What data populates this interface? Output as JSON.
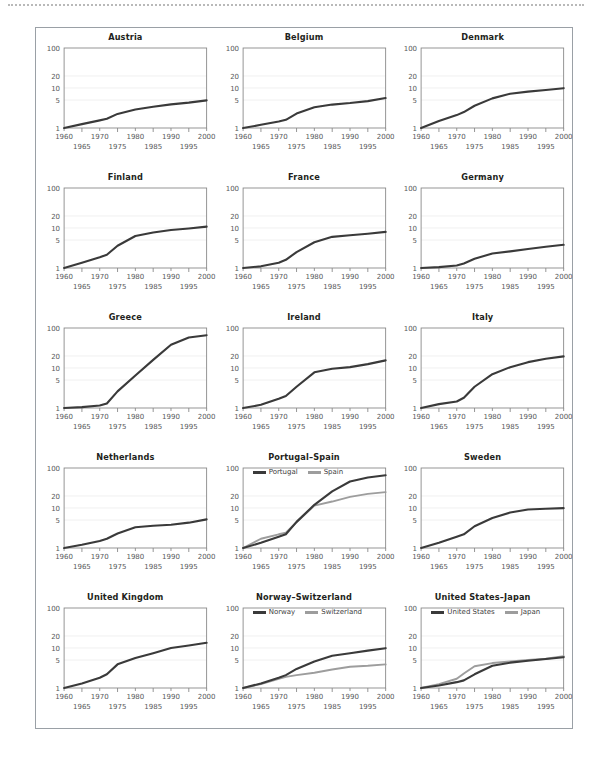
{
  "figure": {
    "layout": {
      "rows": 5,
      "cols": 3
    },
    "colors": {
      "series_primary": "#3a3a3a",
      "series_secondary": "#9d9d9d",
      "axis": "#8a8a8a",
      "grid": "#ececec",
      "tick_text": "#58595b",
      "title_text": "#231f20",
      "frame": "#9aa0a6",
      "top_rule": "#b9b9b9"
    }
  },
  "chart_data": [
    {
      "type": "line",
      "title": "Austria",
      "xlabel": "",
      "ylabel": "",
      "xlim": [
        1960,
        2000
      ],
      "ylim": [
        1,
        100
      ],
      "yscale": "log",
      "grid": true,
      "ytick_labels": [
        "1",
        "5",
        "10",
        "20",
        "100"
      ],
      "yticks": [
        1,
        5,
        10,
        20,
        100
      ],
      "xticks_major": [
        1960,
        1970,
        1980,
        1990,
        2000
      ],
      "xticks_minor": [
        1965,
        1975,
        1985,
        1995
      ],
      "x": [
        1960,
        1965,
        1970,
        1972,
        1975,
        1980,
        1985,
        1990,
        1995,
        2000
      ],
      "series": [
        {
          "name": "Austria",
          "color": "series_primary",
          "values": [
            1.0,
            1.25,
            1.55,
            1.7,
            2.25,
            2.9,
            3.4,
            3.9,
            4.3,
            4.9
          ]
        }
      ]
    },
    {
      "type": "line",
      "title": "Belgium",
      "xlabel": "",
      "ylabel": "",
      "xlim": [
        1960,
        2000
      ],
      "ylim": [
        1,
        100
      ],
      "yscale": "log",
      "grid": true,
      "ytick_labels": [
        "1",
        "5",
        "10",
        "20",
        "100"
      ],
      "yticks": [
        1,
        5,
        10,
        20,
        100
      ],
      "xticks_major": [
        1960,
        1970,
        1980,
        1990,
        2000
      ],
      "xticks_minor": [
        1965,
        1975,
        1985,
        1995
      ],
      "x": [
        1960,
        1965,
        1970,
        1972,
        1975,
        1980,
        1985,
        1990,
        1995,
        2000
      ],
      "series": [
        {
          "name": "Belgium",
          "color": "series_primary",
          "values": [
            1.0,
            1.2,
            1.45,
            1.6,
            2.3,
            3.3,
            3.85,
            4.2,
            4.7,
            5.6
          ]
        }
      ]
    },
    {
      "type": "line",
      "title": "Denmark",
      "xlabel": "",
      "ylabel": "",
      "xlim": [
        1960,
        2000
      ],
      "ylim": [
        1,
        100
      ],
      "yscale": "log",
      "grid": true,
      "ytick_labels": [
        "1",
        "5",
        "10",
        "20",
        "100"
      ],
      "yticks": [
        1,
        5,
        10,
        20,
        100
      ],
      "xticks_major": [
        1960,
        1970,
        1980,
        1990,
        2000
      ],
      "xticks_minor": [
        1965,
        1975,
        1985,
        1995
      ],
      "x": [
        1960,
        1965,
        1970,
        1972,
        1975,
        1980,
        1985,
        1990,
        1995,
        2000
      ],
      "series": [
        {
          "name": "Denmark",
          "color": "series_primary",
          "values": [
            1.0,
            1.5,
            2.1,
            2.5,
            3.6,
            5.5,
            7.2,
            8.1,
            8.9,
            9.9
          ]
        }
      ]
    },
    {
      "type": "line",
      "title": "Finland",
      "xlabel": "",
      "ylabel": "",
      "xlim": [
        1960,
        2000
      ],
      "ylim": [
        1,
        100
      ],
      "yscale": "log",
      "grid": true,
      "ytick_labels": [
        "1",
        "5",
        "10",
        "20",
        "100"
      ],
      "yticks": [
        1,
        5,
        10,
        20,
        100
      ],
      "xticks_major": [
        1960,
        1970,
        1980,
        1990,
        2000
      ],
      "xticks_minor": [
        1965,
        1975,
        1985,
        1995
      ],
      "x": [
        1960,
        1965,
        1970,
        1972,
        1975,
        1980,
        1985,
        1990,
        1995,
        2000
      ],
      "series": [
        {
          "name": "Finland",
          "color": "series_primary",
          "values": [
            1.0,
            1.35,
            1.85,
            2.15,
            3.6,
            6.3,
            7.7,
            8.9,
            9.7,
            10.8
          ]
        }
      ]
    },
    {
      "type": "line",
      "title": "France",
      "xlabel": "",
      "ylabel": "",
      "xlim": [
        1960,
        2000
      ],
      "ylim": [
        1,
        100
      ],
      "yscale": "log",
      "grid": true,
      "ytick_labels": [
        "1",
        "5",
        "10",
        "20",
        "100"
      ],
      "yticks": [
        1,
        5,
        10,
        20,
        100
      ],
      "xticks_major": [
        1960,
        1970,
        1980,
        1990,
        2000
      ],
      "xticks_minor": [
        1965,
        1975,
        1985,
        1995
      ],
      "x": [
        1960,
        1965,
        1970,
        1972,
        1975,
        1980,
        1985,
        1990,
        1995,
        2000
      ],
      "series": [
        {
          "name": "France",
          "color": "series_primary",
          "values": [
            1.0,
            1.1,
            1.35,
            1.6,
            2.5,
            4.4,
            6.0,
            6.6,
            7.2,
            8.0
          ]
        }
      ]
    },
    {
      "type": "line",
      "title": "Germany",
      "xlabel": "",
      "ylabel": "",
      "xlim": [
        1960,
        2000
      ],
      "ylim": [
        1,
        100
      ],
      "yscale": "log",
      "grid": true,
      "ytick_labels": [
        "1",
        "5",
        "10",
        "20",
        "100"
      ],
      "yticks": [
        1,
        5,
        10,
        20,
        100
      ],
      "xticks_major": [
        1960,
        1970,
        1980,
        1990,
        2000
      ],
      "xticks_minor": [
        1965,
        1975,
        1985,
        1995
      ],
      "x": [
        1960,
        1965,
        1970,
        1972,
        1975,
        1980,
        1985,
        1990,
        1995,
        2000
      ],
      "series": [
        {
          "name": "Germany",
          "color": "series_primary",
          "values": [
            1.0,
            1.05,
            1.15,
            1.3,
            1.7,
            2.3,
            2.6,
            3.0,
            3.4,
            3.8
          ]
        }
      ]
    },
    {
      "type": "line",
      "title": "Greece",
      "xlabel": "",
      "ylabel": "",
      "xlim": [
        1960,
        2000
      ],
      "ylim": [
        1,
        100
      ],
      "yscale": "log",
      "grid": true,
      "ytick_labels": [
        "1",
        "5",
        "10",
        "20",
        "100"
      ],
      "yticks": [
        1,
        5,
        10,
        20,
        100
      ],
      "xticks_major": [
        1960,
        1970,
        1980,
        1990,
        2000
      ],
      "xticks_minor": [
        1965,
        1975,
        1985,
        1995
      ],
      "x": [
        1960,
        1965,
        1970,
        1972,
        1975,
        1980,
        1985,
        1990,
        1995,
        2000
      ],
      "series": [
        {
          "name": "Greece",
          "color": "series_primary",
          "values": [
            1.0,
            1.05,
            1.15,
            1.3,
            2.6,
            6.5,
            16.0,
            38.0,
            58.0,
            66.0
          ]
        }
      ]
    },
    {
      "type": "line",
      "title": "Ireland",
      "xlabel": "",
      "ylabel": "",
      "xlim": [
        1960,
        2000
      ],
      "ylim": [
        1,
        100
      ],
      "yscale": "log",
      "grid": true,
      "ytick_labels": [
        "1",
        "5",
        "10",
        "20",
        "100"
      ],
      "yticks": [
        1,
        5,
        10,
        20,
        100
      ],
      "xticks_major": [
        1960,
        1970,
        1980,
        1990,
        2000
      ],
      "xticks_minor": [
        1965,
        1975,
        1985,
        1995
      ],
      "x": [
        1960,
        1965,
        1970,
        1972,
        1975,
        1980,
        1985,
        1990,
        1995,
        2000
      ],
      "series": [
        {
          "name": "Ireland",
          "color": "series_primary",
          "values": [
            1.0,
            1.2,
            1.7,
            2.0,
            3.4,
            7.8,
            9.6,
            10.5,
            12.5,
            15.5
          ]
        }
      ]
    },
    {
      "type": "line",
      "title": "Italy",
      "xlabel": "",
      "ylabel": "",
      "xlim": [
        1960,
        2000
      ],
      "ylim": [
        1,
        100
      ],
      "yscale": "log",
      "grid": true,
      "ytick_labels": [
        "1",
        "5",
        "10",
        "20",
        "100"
      ],
      "yticks": [
        1,
        5,
        10,
        20,
        100
      ],
      "xticks_major": [
        1960,
        1970,
        1980,
        1990,
        2000
      ],
      "xticks_minor": [
        1965,
        1975,
        1985,
        1995
      ],
      "x": [
        1960,
        1965,
        1970,
        1972,
        1975,
        1980,
        1985,
        1990,
        1995,
        2000
      ],
      "series": [
        {
          "name": "Italy",
          "color": "series_primary",
          "values": [
            1.0,
            1.25,
            1.45,
            1.8,
            3.4,
            7.0,
            10.5,
            14.0,
            17.0,
            19.5
          ]
        }
      ]
    },
    {
      "type": "line",
      "title": "Netherlands",
      "xlabel": "",
      "ylabel": "",
      "xlim": [
        1960,
        2000
      ],
      "ylim": [
        1,
        100
      ],
      "yscale": "log",
      "grid": true,
      "ytick_labels": [
        "1",
        "5",
        "10",
        "20",
        "100"
      ],
      "yticks": [
        1,
        5,
        10,
        20,
        100
      ],
      "xticks_major": [
        1960,
        1970,
        1980,
        1990,
        2000
      ],
      "xticks_minor": [
        1965,
        1975,
        1985,
        1995
      ],
      "x": [
        1960,
        1965,
        1970,
        1972,
        1975,
        1980,
        1985,
        1990,
        1995,
        2000
      ],
      "series": [
        {
          "name": "Netherlands",
          "color": "series_primary",
          "values": [
            1.0,
            1.2,
            1.5,
            1.7,
            2.3,
            3.3,
            3.6,
            3.8,
            4.3,
            5.2
          ]
        }
      ]
    },
    {
      "type": "line",
      "title": "Portugal–Spain",
      "xlabel": "",
      "ylabel": "",
      "xlim": [
        1960,
        2000
      ],
      "ylim": [
        1,
        100
      ],
      "yscale": "log",
      "grid": true,
      "ytick_labels": [
        "1",
        "5",
        "10",
        "20",
        "100"
      ],
      "yticks": [
        1,
        5,
        10,
        20,
        100
      ],
      "xticks_major": [
        1960,
        1970,
        1980,
        1990,
        2000
      ],
      "xticks_minor": [
        1965,
        1975,
        1985,
        1995
      ],
      "legend": {
        "position": "top-left",
        "entries": [
          "Portugal",
          "Spain"
        ]
      },
      "x": [
        1960,
        1965,
        1970,
        1972,
        1975,
        1980,
        1985,
        1990,
        1995,
        2000
      ],
      "series": [
        {
          "name": "Portugal",
          "color": "series_primary",
          "values": [
            1.0,
            1.35,
            1.9,
            2.2,
            4.5,
            12.0,
            26.0,
            46.0,
            58.0,
            66.0
          ]
        },
        {
          "name": "Spain",
          "color": "series_secondary",
          "values": [
            1.0,
            1.7,
            2.2,
            2.4,
            4.4,
            11.5,
            14.5,
            19.0,
            22.5,
            25.0
          ]
        }
      ]
    },
    {
      "type": "line",
      "title": "Sweden",
      "xlabel": "",
      "ylabel": "",
      "xlim": [
        1960,
        2000
      ],
      "ylim": [
        1,
        100
      ],
      "yscale": "log",
      "grid": true,
      "ytick_labels": [
        "1",
        "5",
        "10",
        "20",
        "100"
      ],
      "yticks": [
        1,
        5,
        10,
        20,
        100
      ],
      "xticks_major": [
        1960,
        1970,
        1980,
        1990,
        2000
      ],
      "xticks_minor": [
        1965,
        1975,
        1985,
        1995
      ],
      "x": [
        1960,
        1965,
        1970,
        1972,
        1975,
        1980,
        1985,
        1990,
        1995,
        2000
      ],
      "series": [
        {
          "name": "Sweden",
          "color": "series_primary",
          "values": [
            1.0,
            1.35,
            1.9,
            2.2,
            3.5,
            5.6,
            7.7,
            9.2,
            9.6,
            9.9
          ]
        }
      ]
    },
    {
      "type": "line",
      "title": "United Kingdom",
      "xlabel": "",
      "ylabel": "",
      "xlim": [
        1960,
        2000
      ],
      "ylim": [
        1,
        100
      ],
      "yscale": "log",
      "grid": true,
      "ytick_labels": [
        "1",
        "5",
        "10",
        "20",
        "100"
      ],
      "yticks": [
        1,
        5,
        10,
        20,
        100
      ],
      "xticks_major": [
        1960,
        1970,
        1980,
        1990,
        2000
      ],
      "xticks_minor": [
        1965,
        1975,
        1985,
        1995
      ],
      "x": [
        1960,
        1965,
        1970,
        1972,
        1975,
        1980,
        1985,
        1990,
        1995,
        2000
      ],
      "series": [
        {
          "name": "United Kingdom",
          "color": "series_primary",
          "values": [
            1.0,
            1.3,
            1.8,
            2.2,
            3.9,
            5.6,
            7.4,
            10.0,
            11.5,
            13.5
          ]
        }
      ]
    },
    {
      "type": "line",
      "title": "Norway–Switzerland",
      "xlabel": "",
      "ylabel": "",
      "xlim": [
        1960,
        2000
      ],
      "ylim": [
        1,
        100
      ],
      "yscale": "log",
      "grid": true,
      "ytick_labels": [
        "1",
        "5",
        "10",
        "20",
        "100"
      ],
      "yticks": [
        1,
        5,
        10,
        20,
        100
      ],
      "xticks_major": [
        1960,
        1970,
        1980,
        1990,
        2000
      ],
      "xticks_minor": [
        1965,
        1975,
        1985,
        1995
      ],
      "legend": {
        "position": "top-left",
        "entries": [
          "Norway",
          "Switzerland"
        ]
      },
      "x": [
        1960,
        1965,
        1970,
        1972,
        1975,
        1980,
        1985,
        1990,
        1995,
        2000
      ],
      "series": [
        {
          "name": "Norway",
          "color": "series_primary",
          "values": [
            1.0,
            1.3,
            1.8,
            2.1,
            3.0,
            4.6,
            6.4,
            7.4,
            8.6,
            9.9
          ]
        },
        {
          "name": "Switzerland",
          "color": "series_secondary",
          "values": [
            1.0,
            1.25,
            1.7,
            1.9,
            2.1,
            2.4,
            2.9,
            3.4,
            3.6,
            3.9
          ]
        }
      ]
    },
    {
      "type": "line",
      "title": "United States–Japan",
      "xlabel": "",
      "ylabel": "",
      "xlim": [
        1960,
        2000
      ],
      "ylim": [
        1,
        100
      ],
      "yscale": "log",
      "grid": true,
      "ytick_labels": [
        "1",
        "5",
        "10",
        "20",
        "100"
      ],
      "yticks": [
        1,
        5,
        10,
        20,
        100
      ],
      "xticks_major": [
        1960,
        1970,
        1980,
        1990,
        2000
      ],
      "xticks_minor": [
        1965,
        1975,
        1985,
        1995
      ],
      "legend": {
        "position": "top-left",
        "entries": [
          "United States",
          "Japan"
        ]
      },
      "x": [
        1960,
        1965,
        1970,
        1972,
        1975,
        1980,
        1985,
        1990,
        1995,
        2000
      ],
      "series": [
        {
          "name": "United States",
          "color": "series_primary",
          "values": [
            1.0,
            1.15,
            1.4,
            1.55,
            2.2,
            3.6,
            4.3,
            4.8,
            5.3,
            5.9
          ]
        },
        {
          "name": "Japan",
          "color": "series_secondary",
          "values": [
            1.0,
            1.25,
            1.7,
            2.3,
            3.5,
            4.2,
            4.6,
            5.0,
            5.4,
            6.2
          ]
        }
      ]
    }
  ]
}
